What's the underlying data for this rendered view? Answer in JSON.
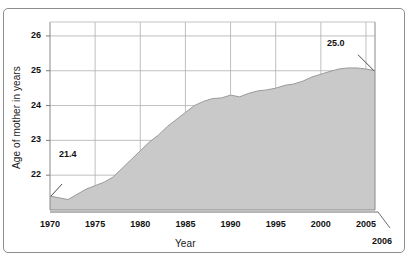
{
  "chart_data": {
    "type": "area",
    "title": "",
    "xlabel": "Year",
    "ylabel": "Age of mother in years",
    "xlim": [
      1970,
      2006
    ],
    "ylim": [
      21.0,
      26.4
    ],
    "grid": true,
    "legend": false,
    "fill_color": "#c9c9c9",
    "line_color": "#9a9a9a",
    "grid_color": "#b0b0b0",
    "axis_color": "#7a7a7a",
    "x_ticks": [
      "1970",
      "1975",
      "1980",
      "1985",
      "1990",
      "1995",
      "2000",
      "2005"
    ],
    "x_tick_values": [
      1970,
      1975,
      1980,
      1985,
      1990,
      1995,
      2000,
      2005
    ],
    "y_ticks": [
      "22",
      "23",
      "24",
      "25",
      "26"
    ],
    "y_tick_values": [
      22,
      23,
      24,
      25,
      26
    ],
    "extra_x_label": "2006",
    "x": [
      1970,
      1971,
      1972,
      1973,
      1974,
      1975,
      1976,
      1977,
      1978,
      1979,
      1980,
      1981,
      1982,
      1983,
      1984,
      1985,
      1986,
      1987,
      1988,
      1989,
      1990,
      1991,
      1992,
      1993,
      1994,
      1995,
      1996,
      1997,
      1998,
      1999,
      2000,
      2001,
      2002,
      2003,
      2004,
      2005,
      2006
    ],
    "values": [
      21.4,
      21.35,
      21.3,
      21.45,
      21.6,
      21.7,
      21.8,
      21.95,
      22.2,
      22.45,
      22.7,
      22.95,
      23.15,
      23.4,
      23.6,
      23.8,
      24.0,
      24.12,
      24.2,
      24.22,
      24.3,
      24.25,
      24.35,
      24.42,
      24.45,
      24.5,
      24.58,
      24.62,
      24.7,
      24.82,
      24.9,
      24.98,
      25.05,
      25.08,
      25.08,
      25.05,
      25.0
    ],
    "annotations": [
      {
        "label": "21.4",
        "x": 1970,
        "y": 21.4,
        "position": "right-above"
      },
      {
        "label": "25.0",
        "x": 2006,
        "y": 25.0,
        "position": "left-above"
      }
    ]
  },
  "header": {
    "clipped_text": ""
  }
}
